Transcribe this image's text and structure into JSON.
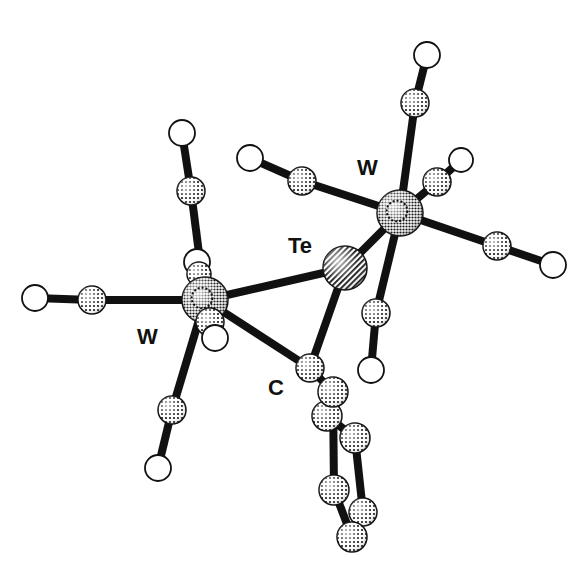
{
  "figure": {
    "type": "molecular-structure",
    "style": "ball-and-stick",
    "colors": {
      "bond": "#111111",
      "oxygen_fill": "#ffffff",
      "atom_outline": "#111111"
    },
    "labels": {
      "tungsten_left": "W",
      "tungsten_right": "W",
      "tellurium": "Te",
      "carbene_carbon": "C"
    },
    "atoms": [
      {
        "id": "W1",
        "element": "W",
        "shade": "dark-dotted"
      },
      {
        "id": "W2",
        "element": "W",
        "shade": "dark-dotted"
      },
      {
        "id": "Te",
        "element": "Te",
        "shade": "hatched"
      },
      {
        "id": "C1",
        "element": "C",
        "shade": "dotted"
      },
      {
        "id": "C2",
        "element": "C",
        "shade": "dotted"
      },
      {
        "id": "O2",
        "element": "O",
        "shade": "open"
      },
      {
        "id": "C3",
        "element": "C",
        "shade": "dotted"
      },
      {
        "id": "O3",
        "element": "O",
        "shade": "open"
      },
      {
        "id": "C4",
        "element": "C",
        "shade": "dotted"
      },
      {
        "id": "O4",
        "element": "O",
        "shade": "open"
      },
      {
        "id": "C5",
        "element": "C",
        "shade": "dotted"
      },
      {
        "id": "O5",
        "element": "O",
        "shade": "open"
      },
      {
        "id": "C6",
        "element": "C",
        "shade": "dotted"
      },
      {
        "id": "O6",
        "element": "O",
        "shade": "open"
      },
      {
        "id": "C7",
        "element": "C",
        "shade": "dotted"
      },
      {
        "id": "O7",
        "element": "O",
        "shade": "open"
      },
      {
        "id": "C8",
        "element": "C",
        "shade": "dotted"
      },
      {
        "id": "O8",
        "element": "O",
        "shade": "open"
      },
      {
        "id": "C9",
        "element": "C",
        "shade": "dotted"
      },
      {
        "id": "O9",
        "element": "O",
        "shade": "open"
      },
      {
        "id": "C10",
        "element": "C",
        "shade": "dotted"
      },
      {
        "id": "O10",
        "element": "O",
        "shade": "open"
      },
      {
        "id": "C11",
        "element": "C",
        "shade": "dotted"
      },
      {
        "id": "O11",
        "element": "O",
        "shade": "open"
      },
      {
        "id": "Ph1",
        "element": "C",
        "shade": "dotted"
      },
      {
        "id": "Ph2",
        "element": "C",
        "shade": "dotted"
      },
      {
        "id": "Ph3",
        "element": "C",
        "shade": "dotted"
      },
      {
        "id": "Ph4",
        "element": "C",
        "shade": "dotted"
      },
      {
        "id": "Ph5",
        "element": "C",
        "shade": "dotted"
      },
      {
        "id": "Ph6",
        "element": "C",
        "shade": "dotted"
      }
    ],
    "bonds": [
      [
        "W1",
        "Te"
      ],
      [
        "W1",
        "C1"
      ],
      [
        "Te",
        "C1"
      ],
      [
        "W2",
        "Te"
      ],
      [
        "C1",
        "Ph1"
      ],
      [
        "W1",
        "C2"
      ],
      [
        "C2",
        "O2"
      ],
      [
        "W1",
        "C3"
      ],
      [
        "C3",
        "O3"
      ],
      [
        "W1",
        "C4"
      ],
      [
        "C4",
        "O4"
      ],
      [
        "W1",
        "C5"
      ],
      [
        "C5",
        "O5"
      ],
      [
        "W1",
        "C6"
      ],
      [
        "C6",
        "O6"
      ],
      [
        "W2",
        "C7"
      ],
      [
        "C7",
        "O7"
      ],
      [
        "W2",
        "C8"
      ],
      [
        "C8",
        "O8"
      ],
      [
        "W2",
        "C9"
      ],
      [
        "C9",
        "O9"
      ],
      [
        "W2",
        "C10"
      ],
      [
        "C10",
        "O10"
      ],
      [
        "W2",
        "C11"
      ],
      [
        "C11",
        "O11"
      ],
      [
        "Ph1",
        "Ph2"
      ],
      [
        "Ph2",
        "Ph3"
      ],
      [
        "Ph3",
        "Ph5"
      ],
      [
        "Ph5",
        "Ph6"
      ],
      [
        "Ph6",
        "Ph4"
      ],
      [
        "Ph4",
        "Ph1"
      ]
    ]
  }
}
